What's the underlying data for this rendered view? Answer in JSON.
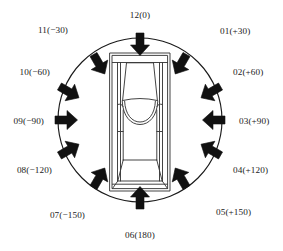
{
  "figure": {
    "type": "diagram",
    "center_object": "car",
    "center_object_view": "top-down",
    "ring_shape": "circle",
    "arrow_count": 12,
    "arrow_direction": "inward-toward-car",
    "arrow_color": "#111111",
    "circle_color": "#1a1a1a",
    "car_outline_color": "#3a3a3a",
    "background": "#ffffff",
    "angle_step_degrees": 30
  },
  "geometry": {
    "circle_center_x": 140,
    "circle_center_y": 120,
    "circle_radius": 82,
    "car_center_x": 140,
    "car_center_y": 122,
    "car_width": 60,
    "car_height": 138
  },
  "directions": [
    {
      "id": "12",
      "angle_text": "(0)",
      "label": "12(0)",
      "angle_deg": 0,
      "label_x": 140,
      "label_y": 16,
      "align": "c",
      "arrow_x": 140,
      "arrow_y": 44,
      "arrow_rot": 180
    },
    {
      "id": "01",
      "angle_text": "(+30)",
      "label": "01(+30)",
      "angle_deg": 30,
      "label_x": 220,
      "label_y": 32,
      "align": "l",
      "arrow_x": 181,
      "arrow_y": 64,
      "arrow_rot": 210
    },
    {
      "id": "02",
      "angle_text": "(+60)",
      "label": "02(+60)",
      "angle_deg": 60,
      "label_x": 233,
      "label_y": 73,
      "align": "l",
      "arrow_x": 211,
      "arrow_y": 92,
      "arrow_rot": 240
    },
    {
      "id": "03",
      "angle_text": "(+90)",
      "label": "03(+90)",
      "angle_deg": 90,
      "label_x": 239,
      "label_y": 122,
      "align": "l",
      "arrow_x": 214,
      "arrow_y": 120,
      "arrow_rot": 270
    },
    {
      "id": "04",
      "angle_text": "(+120)",
      "label": "04(+120)",
      "angle_deg": 120,
      "label_x": 233,
      "label_y": 171,
      "align": "l",
      "arrow_x": 211,
      "arrow_y": 150,
      "arrow_rot": 300
    },
    {
      "id": "05",
      "angle_text": "(+150)",
      "label": "05(+150)",
      "angle_deg": 150,
      "label_x": 216,
      "label_y": 213,
      "align": "l",
      "arrow_x": 181,
      "arrow_y": 178,
      "arrow_rot": 330
    },
    {
      "id": "06",
      "angle_text": "(180)",
      "label": "06(180)",
      "angle_deg": 180,
      "label_x": 140,
      "label_y": 236,
      "align": "c",
      "arrow_x": 140,
      "arrow_y": 198,
      "arrow_rot": 0
    },
    {
      "id": "07",
      "angle_text": "(−150)",
      "label": "07(−150)",
      "angle_deg": -150,
      "label_x": 85,
      "label_y": 216,
      "align": "r",
      "arrow_x": 99,
      "arrow_y": 178,
      "arrow_rot": 30
    },
    {
      "id": "08",
      "angle_text": "(−120)",
      "label": "08(−120)",
      "angle_deg": -120,
      "label_x": 52,
      "label_y": 171,
      "align": "r",
      "arrow_x": 69,
      "arrow_y": 150,
      "arrow_rot": 60
    },
    {
      "id": "09",
      "angle_text": "(−90)",
      "label": "09(−90)",
      "angle_deg": -90,
      "label_x": 44,
      "label_y": 122,
      "align": "r",
      "arrow_x": 66,
      "arrow_y": 120,
      "arrow_rot": 90
    },
    {
      "id": "10",
      "angle_text": "(−60)",
      "label": "10(−60)",
      "angle_deg": -60,
      "label_x": 50,
      "label_y": 73,
      "align": "r",
      "arrow_x": 69,
      "arrow_y": 92,
      "arrow_rot": 120
    },
    {
      "id": "11",
      "angle_text": "(−30)",
      "label": "11(−30)",
      "angle_deg": -30,
      "label_x": 68,
      "label_y": 31,
      "align": "r",
      "arrow_x": 99,
      "arrow_y": 64,
      "arrow_rot": 150
    }
  ]
}
